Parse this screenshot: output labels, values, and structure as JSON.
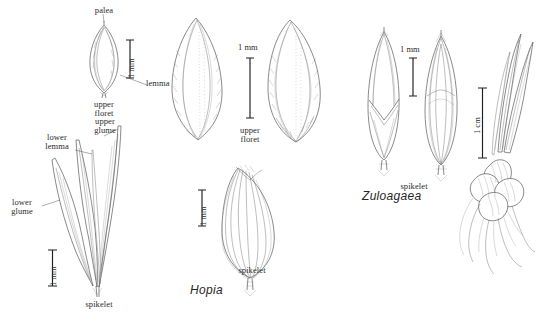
{
  "plate": {
    "title": "Grass spikelet line-drawing plate",
    "background_color": "#ffffff",
    "ink_color": "#4a4a4a",
    "scalebar_color": "#1f1f1f",
    "genus_label_color": "#262626"
  },
  "panels": [
    {
      "id": "left-panel",
      "genus": "",
      "figures": [
        {
          "id": "upper-floret-left",
          "caption_line1": "upper",
          "caption_line2": "floret",
          "callouts": [
            {
              "name": "palea-label",
              "text": "palea"
            },
            {
              "name": "lemma-label",
              "text": "lemma"
            }
          ],
          "scale": {
            "value": "1 mm",
            "orientation": "vertical"
          }
        },
        {
          "id": "spikelet-left",
          "caption_line1": "spikelet",
          "caption_line2": "",
          "callouts": [
            {
              "name": "upper-glume-label",
              "text": "upper\nglume"
            },
            {
              "name": "lower-lemma-label",
              "text": "lower\nlemma"
            },
            {
              "name": "lower-glume-label",
              "text": "lower\nglume"
            }
          ],
          "scale": {
            "value": "1 mm",
            "orientation": "vertical"
          }
        }
      ]
    },
    {
      "id": "center-panel",
      "genus": "Hopia",
      "figures": [
        {
          "id": "upper-floret-hopia",
          "caption_line1": "upper",
          "caption_line2": "floret",
          "callouts": [],
          "scale": {
            "value": "1 mm",
            "orientation": "horizontal"
          }
        },
        {
          "id": "spikelet-hopia",
          "caption_line1": "spikelet",
          "caption_line2": "",
          "callouts": [],
          "scale": {
            "value": "1 mm",
            "orientation": "vertical"
          }
        }
      ]
    },
    {
      "id": "right-panel",
      "genus": "Zuloagaea",
      "figures": [
        {
          "id": "spikelet-zuloagaea",
          "caption_line1": "spikelet",
          "caption_line2": "",
          "callouts": [],
          "scale": {
            "value": "1 mm",
            "orientation": "horizontal"
          }
        },
        {
          "id": "rhizome-zuloagaea",
          "caption_line1": "",
          "caption_line2": "",
          "callouts": [],
          "scale": {
            "value": "1 cm",
            "orientation": "vertical"
          }
        }
      ]
    }
  ],
  "labels": {
    "palea": "palea",
    "lemma": "lemma",
    "upper_floret_l1": "upper",
    "upper_floret_l2": "floret",
    "upper_glume_l1": "upper",
    "upper_glume_l2": "glume",
    "lower_lemma_l1": "lower",
    "lower_lemma_l2": "lemma",
    "lower_glume_l1": "lower",
    "lower_glume_l2": "glume",
    "spikelet_left": "spikelet",
    "upper_floret_center_l1": "upper",
    "upper_floret_center_l2": "floret",
    "spikelet_center": "spikelet",
    "spikelet_right": "spikelet",
    "genus_hopia": "Hopia",
    "genus_zuloagaea": "Zuloagaea"
  },
  "scales": {
    "left_floret": "1 mm",
    "left_spikelet": "1 mm",
    "center_floret": "1 mm",
    "center_spikelet": "1 mm",
    "right_spikelet": "1 mm",
    "right_rhizome": "1 cm"
  }
}
